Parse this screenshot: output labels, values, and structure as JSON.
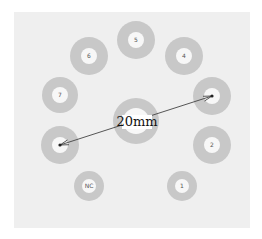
{
  "diagram": {
    "title": "",
    "colors": {
      "background": "#efefef",
      "ring": "#c8c8c8",
      "hole": "#f7f7f7",
      "arrow": "#444444",
      "label_bg": "#ffffff"
    },
    "pins": [
      {
        "id": "pin-5",
        "label": "5"
      },
      {
        "id": "pin-6",
        "label": "6"
      },
      {
        "id": "pin-4",
        "label": "4"
      },
      {
        "id": "pin-7",
        "label": "7"
      },
      {
        "id": "pin-3",
        "label": ""
      },
      {
        "id": "pin-8",
        "label": ""
      },
      {
        "id": "pin-2",
        "label": "2"
      },
      {
        "id": "pin-nc",
        "label": "NC"
      },
      {
        "id": "pin-1",
        "label": "1"
      }
    ],
    "center_hole": {
      "id": "center-hole",
      "label": ""
    },
    "dimension": {
      "label": "20mm",
      "from_pin": "pin-8",
      "to_pin": "pin-3"
    }
  }
}
